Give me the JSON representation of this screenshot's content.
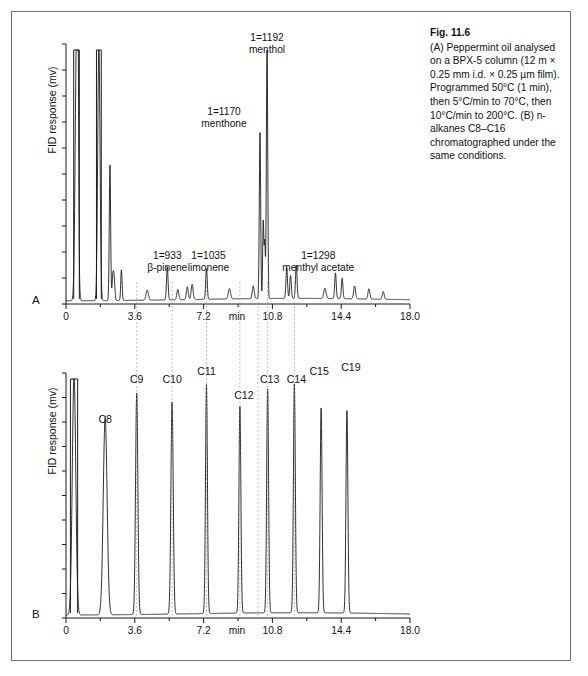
{
  "figure": {
    "caption_title": "Fig. 11.6",
    "caption_body": "(A) Peppermint oil analysed on a BPX-5 column (12 m × 0.25 mm i.d. × 0.25 µm film). Programmed 50°C (1 min), then 5°C/min to 70°C, then 10°C/min to 200°C. (B) n-alkanes C8–C16 chromatographed under the same conditions."
  },
  "panel_a": {
    "letter": "A",
    "ylabel": "FID response (mv)",
    "xunit": "min",
    "xticks": [
      "0",
      "3.6",
      "7.2",
      "10.8",
      "14.4",
      "18.0"
    ],
    "peak_labels": [
      {
        "index": "1=933",
        "name": "β-pinene"
      },
      {
        "index": "1=1035",
        "name": "limonene"
      },
      {
        "index": "1=1170",
        "name": "menthone"
      },
      {
        "index": "1=1192",
        "name": "menthol"
      },
      {
        "index": "1=1298",
        "name": "menthyl acetate"
      }
    ]
  },
  "panel_b": {
    "letter": "B",
    "ylabel": "FID response (mv)",
    "xunit": "min",
    "xticks": [
      "0",
      "3.6",
      "7.2",
      "10.8",
      "14.4",
      "18.0"
    ],
    "alkane_labels": [
      "C8",
      "C9",
      "C10",
      "C11",
      "C12",
      "C13",
      "C14",
      "C15",
      "C19"
    ]
  },
  "colors": {
    "trace": "#1a1a1a",
    "axis": "#1a1a1a",
    "guide": "#9a9a9a",
    "frame": "#6e6e6e"
  },
  "chart_data": {
    "type": "line",
    "charts": [
      {
        "id": "A",
        "title": "Peppermint oil (BPX-5)",
        "xlabel": "min",
        "ylabel": "FID response (mv)",
        "xlim": [
          0,
          18.0
        ],
        "ylim": [
          0,
          100
        ],
        "xticks": [
          0,
          3.6,
          7.2,
          10.8,
          14.4,
          18.0
        ],
        "grid": false,
        "legend": "none",
        "peaks": [
          {
            "rt": 0.55,
            "height": 100,
            "label": "solvent",
            "clipped": true,
            "width": 0.07
          },
          {
            "rt": 0.6,
            "height": 48,
            "label": "",
            "width": 0.03
          },
          {
            "rt": 0.64,
            "height": 45,
            "label": "",
            "width": 0.03
          },
          {
            "rt": 1.72,
            "height": 100,
            "label": "",
            "clipped": true,
            "width": 0.06
          },
          {
            "rt": 2.3,
            "height": 53,
            "label": "",
            "width": 0.035
          },
          {
            "rt": 2.45,
            "height": 9,
            "label": "",
            "width": 0.04
          },
          {
            "rt": 2.52,
            "height": 8,
            "label": "",
            "width": 0.04
          },
          {
            "rt": 2.9,
            "height": 12,
            "label": "",
            "width": 0.035
          },
          {
            "rt": 4.25,
            "height": 4,
            "label": "",
            "width": 0.06
          },
          {
            "rt": 5.3,
            "height": 13,
            "label": "β-pinene",
            "index": 933,
            "width": 0.04
          },
          {
            "rt": 5.85,
            "height": 4,
            "label": "",
            "width": 0.05
          },
          {
            "rt": 6.35,
            "height": 5,
            "label": "",
            "width": 0.05
          },
          {
            "rt": 6.6,
            "height": 6,
            "label": "",
            "width": 0.05
          },
          {
            "rt": 7.35,
            "height": 12,
            "label": "limonene",
            "index": 1035,
            "width": 0.04
          },
          {
            "rt": 8.55,
            "height": 4,
            "label": "",
            "width": 0.06
          },
          {
            "rt": 9.8,
            "height": 5,
            "label": "",
            "width": 0.05
          },
          {
            "rt": 10.15,
            "height": 65,
            "label": "menthone",
            "index": 1170,
            "width": 0.035
          },
          {
            "rt": 10.32,
            "height": 30,
            "label": "",
            "width": 0.03
          },
          {
            "rt": 10.4,
            "height": 22,
            "label": "",
            "width": 0.03
          },
          {
            "rt": 10.52,
            "height": 100,
            "label": "menthol",
            "index": 1192,
            "clipped": false,
            "width": 0.035
          },
          {
            "rt": 11.55,
            "height": 12,
            "label": "",
            "width": 0.04
          },
          {
            "rt": 11.75,
            "height": 9,
            "label": "",
            "width": 0.04
          },
          {
            "rt": 12.05,
            "height": 13,
            "label": "menthyl acetate",
            "index": 1298,
            "width": 0.04
          },
          {
            "rt": 13.55,
            "height": 4,
            "label": "",
            "width": 0.06
          },
          {
            "rt": 14.1,
            "height": 10,
            "label": "",
            "width": 0.04
          },
          {
            "rt": 14.45,
            "height": 8,
            "label": "",
            "width": 0.04
          },
          {
            "rt": 15.1,
            "height": 5,
            "label": "",
            "width": 0.05
          },
          {
            "rt": 15.85,
            "height": 4,
            "label": "",
            "width": 0.05
          },
          {
            "rt": 16.6,
            "height": 3,
            "label": "",
            "width": 0.05
          }
        ]
      },
      {
        "id": "B",
        "title": "n-alkanes C8–C16",
        "xlabel": "min",
        "ylabel": "FID response (mv)",
        "xlim": [
          0,
          18.0
        ],
        "ylim": [
          0,
          100
        ],
        "xticks": [
          0,
          3.6,
          7.2,
          10.8,
          14.4,
          18.0
        ],
        "grid": false,
        "legend": "none",
        "peaks": [
          {
            "rt": 0.42,
            "height": 100,
            "label": "solvent",
            "clipped": true,
            "width": 0.09
          },
          {
            "rt": 2.05,
            "height": 82,
            "label": "C8",
            "width": 0.1
          },
          {
            "rt": 3.7,
            "height": 92,
            "label": "C9",
            "width": 0.06
          },
          {
            "rt": 5.55,
            "height": 88,
            "label": "C10",
            "width": 0.06
          },
          {
            "rt": 7.35,
            "height": 95,
            "label": "C11",
            "width": 0.05
          },
          {
            "rt": 9.1,
            "height": 86,
            "label": "C12",
            "width": 0.05
          },
          {
            "rt": 10.55,
            "height": 93,
            "label": "C13",
            "width": 0.05
          },
          {
            "rt": 11.95,
            "height": 95,
            "label": "C14",
            "width": 0.05
          },
          {
            "rt": 13.35,
            "height": 85,
            "label": "C15",
            "width": 0.05
          },
          {
            "rt": 14.7,
            "height": 84,
            "label": "C19",
            "width": 0.05
          }
        ]
      }
    ],
    "guides": {
      "description": "Dotted vertical guide lines linking alkane retention times in panel B to peaks in panel A",
      "rt_values": [
        3.7,
        5.55,
        7.35,
        9.1,
        10.05,
        10.55,
        11.95
      ]
    }
  }
}
